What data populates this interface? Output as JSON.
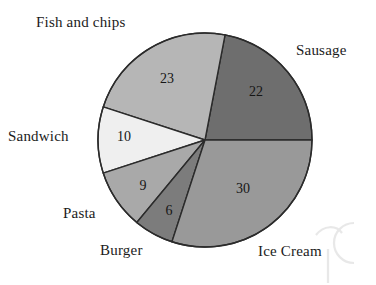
{
  "chart_data": {
    "type": "pie",
    "title": "",
    "subtitle": "",
    "xlabel": "",
    "ylabel": "",
    "legend_position": "around-slices",
    "grid": false,
    "total": 100,
    "categories": [
      "Sausage",
      "Ice Cream",
      "Burger",
      "Pasta",
      "Sandwich",
      "Fish and chips"
    ],
    "values": [
      22,
      30,
      6,
      9,
      10,
      23
    ],
    "slices": [
      {
        "label": "Sausage",
        "value": 22,
        "value_text": "22",
        "color": "#6e6e6e",
        "start_angle_deg": 0,
        "end_angle_deg": 79.2,
        "value_x": 256,
        "value_y": 93,
        "label_left": 296,
        "label_top": 42
      },
      {
        "label": "Fish and chips",
        "value": 23,
        "value_text": "23",
        "color": "#b6b6b6",
        "start_angle_deg": 79.2,
        "end_angle_deg": 162.0,
        "value_x": 167,
        "value_y": 80,
        "label_left": 36,
        "label_top": 14
      },
      {
        "label": "Sandwich",
        "value": 10,
        "value_text": "10",
        "color": "#efefef",
        "start_angle_deg": 162.0,
        "end_angle_deg": 198.0,
        "value_x": 124,
        "value_y": 138,
        "label_left": 8,
        "label_top": 128
      },
      {
        "label": "Pasta",
        "value": 9,
        "value_text": "9",
        "color": "#a9a9a9",
        "start_angle_deg": 198.0,
        "end_angle_deg": 230.4,
        "value_x": 143,
        "value_y": 187,
        "label_left": 63,
        "label_top": 205
      },
      {
        "label": "Burger",
        "value": 6,
        "value_text": "6",
        "color": "#7c7c7c",
        "start_angle_deg": 230.4,
        "end_angle_deg": 252.0,
        "value_x": 169,
        "value_y": 212,
        "label_left": 100,
        "label_top": 242
      },
      {
        "label": "Ice Cream",
        "value": 30,
        "value_text": "30",
        "color": "#999999",
        "start_angle_deg": 252.0,
        "end_angle_deg": 360.0,
        "value_x": 243,
        "value_y": 190,
        "label_left": 258,
        "label_top": 243
      }
    ],
    "geometry": {
      "center_x": 205,
      "center_y": 140,
      "radius": 107,
      "direction": "counterclockwise",
      "start_at": "3-oclock"
    },
    "style": {
      "outline_color": "#2b2b2b",
      "outline_width": 1.4,
      "background": "#ffffff",
      "value_text_color": "#161616",
      "label_text_color": "#1b1b1b"
    }
  },
  "watermark": {
    "name": "faint-watermark-artifact",
    "opacity": "0.22"
  }
}
